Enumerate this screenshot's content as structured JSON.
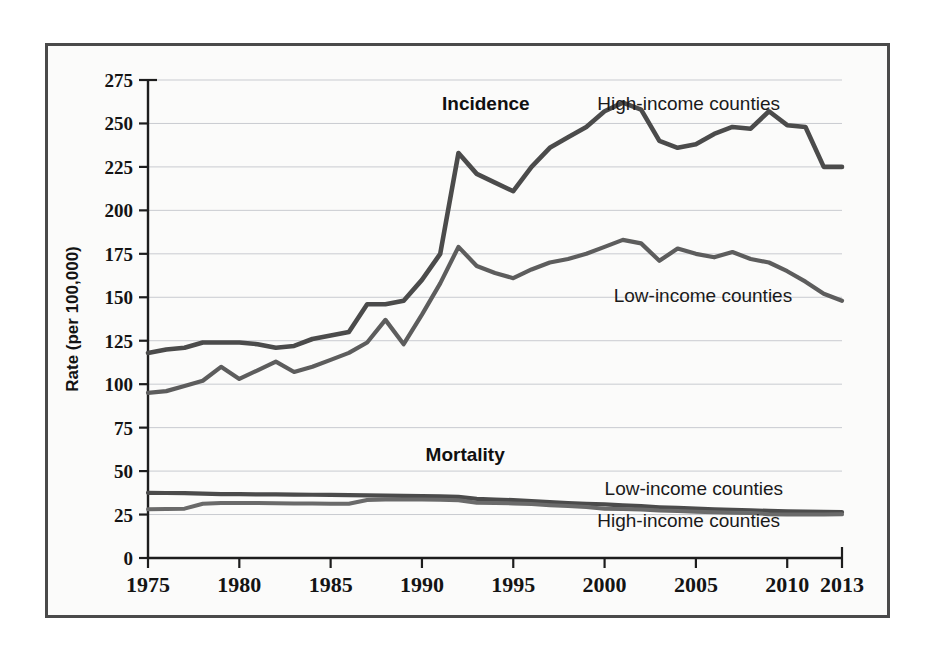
{
  "chart_data": {
    "type": "line",
    "title": "",
    "xlabel": "",
    "ylabel": "Rate (per 100,000)",
    "xlim": [
      1975,
      2013
    ],
    "ylim": [
      0,
      275
    ],
    "grid": true,
    "legend_position": "inline-annotations",
    "x_ticks": [
      1975,
      1980,
      1985,
      1990,
      1995,
      2000,
      2005,
      2010,
      2013
    ],
    "y_ticks": [
      0,
      25,
      50,
      75,
      100,
      125,
      150,
      175,
      200,
      225,
      250,
      275
    ],
    "x": [
      1975,
      1976,
      1977,
      1978,
      1979,
      1980,
      1981,
      1982,
      1983,
      1984,
      1985,
      1986,
      1987,
      1988,
      1989,
      1990,
      1991,
      1992,
      1993,
      1994,
      1995,
      1996,
      1997,
      1998,
      1999,
      2000,
      2001,
      2002,
      2003,
      2004,
      2005,
      2006,
      2007,
      2008,
      2009,
      2010,
      2011,
      2012,
      2013
    ],
    "series": [
      {
        "name": "Incidence — High-income counties",
        "group": "Incidence",
        "label": "High-income counties",
        "color": "#4b4b4b",
        "values": [
          118,
          120,
          121,
          124,
          124,
          124,
          123,
          121,
          122,
          126,
          128,
          130,
          146,
          146,
          148,
          160,
          175,
          233,
          221,
          216,
          211,
          225,
          236,
          242,
          248,
          257,
          262,
          258,
          240,
          236,
          238,
          244,
          248,
          247,
          257,
          249,
          248,
          225,
          225
        ]
      },
      {
        "name": "Incidence — Low-income counties",
        "group": "Incidence",
        "label": "Low-income counties",
        "color": "#5d5d5d",
        "values": [
          95,
          96,
          99,
          102,
          110,
          103,
          108,
          113,
          107,
          110,
          114,
          118,
          124,
          137,
          123,
          140,
          158,
          179,
          168,
          164,
          161,
          166,
          170,
          172,
          175,
          179,
          183,
          181,
          171,
          178,
          175,
          173,
          176,
          172,
          170,
          165,
          159,
          152,
          148
        ]
      },
      {
        "name": "Mortality — Low-income counties",
        "group": "Mortality",
        "label": "Low-income counties",
        "color": "#4b4b4b",
        "values": [
          37.5,
          37.4,
          37.3,
          37.0,
          36.8,
          36.7,
          36.6,
          36.6,
          36.5,
          36.4,
          36.3,
          36.2,
          36.0,
          35.9,
          35.7,
          35.6,
          35.5,
          35.2,
          34.0,
          33.6,
          33.3,
          32.8,
          32.2,
          31.6,
          31.2,
          30.8,
          30.3,
          29.8,
          29.2,
          28.8,
          28.4,
          28.0,
          27.7,
          27.4,
          27.1,
          26.9,
          26.7,
          26.5,
          26.4
        ]
      },
      {
        "name": "Mortality — High-income counties",
        "group": "Mortality",
        "label": "High-income counties",
        "color": "#6a6a6a",
        "values": [
          28.0,
          28.2,
          28.4,
          31.2,
          31.6,
          31.7,
          31.6,
          31.5,
          31.4,
          31.3,
          31.2,
          31.2,
          33.4,
          33.6,
          33.6,
          33.6,
          33.5,
          33.2,
          31.8,
          31.6,
          31.4,
          31.0,
          30.4,
          29.9,
          29.4,
          28.4,
          28.2,
          27.9,
          27.3,
          27.0,
          26.6,
          26.3,
          26.1,
          25.9,
          25.2,
          25.0,
          25.0,
          25.0,
          25.1
        ]
      }
    ],
    "annotations": [
      {
        "id": "incidence-group",
        "text": "Incidence",
        "bold": true,
        "x": 1991.1,
        "y": 258
      },
      {
        "id": "incidence-high-label",
        "text": "High-income counties",
        "bold": false,
        "x": 1999.6,
        "y": 258
      },
      {
        "id": "incidence-low-label",
        "text": "Low-income counties",
        "bold": false,
        "x": 2000.5,
        "y": 147
      },
      {
        "id": "mortality-group",
        "text": "Mortality",
        "bold": true,
        "x": 1990.2,
        "y": 56
      },
      {
        "id": "mortality-low-label",
        "text": "Low-income counties",
        "bold": false,
        "x": 2000.0,
        "y": 36
      },
      {
        "id": "mortality-high-label",
        "text": "High-income counties",
        "bold": false,
        "x": 1999.6,
        "y": 18
      }
    ]
  },
  "axes": {
    "y_title": "Rate (per 100,000)",
    "y_tick_labels": [
      "275",
      "250",
      "225",
      "200",
      "175",
      "150",
      "125",
      "100",
      "75",
      "50",
      "25",
      "0"
    ],
    "x_tick_labels": [
      "1975",
      "1980",
      "1985",
      "1990",
      "1995",
      "2000",
      "2005",
      "2010",
      "2013"
    ]
  },
  "figure": {
    "background_color": "#fbfbfa",
    "border_color": "#4a4a4a",
    "gridline_color": "#c9cbd0",
    "axis_color": "#1d1d1d"
  }
}
